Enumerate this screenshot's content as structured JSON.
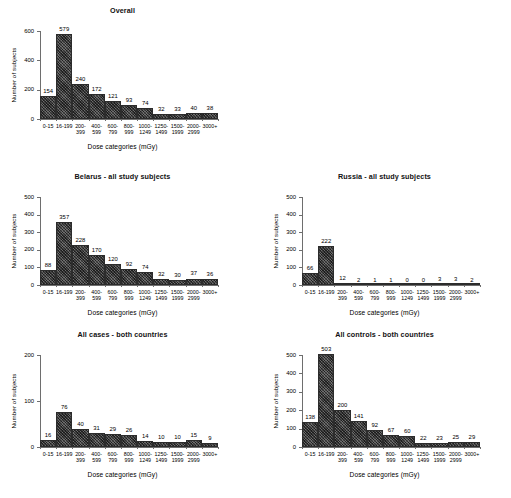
{
  "figure": {
    "background": "#ffffff",
    "bar_color": "#4b4b4b",
    "axis_color": "#6e6e6e",
    "xlabel": "Dose categories (mGy)",
    "ylabel": "Number of subjects",
    "categories": [
      "0-15",
      "16-199",
      "200-399",
      "400-599",
      "600-799",
      "800-999",
      "1000-1249",
      "1250-1499",
      "1500-1999",
      "2000-2999",
      "3000+"
    ],
    "category_lines": [
      [
        "0-15",
        ""
      ],
      [
        "16-199",
        ""
      ],
      [
        "200-",
        "399"
      ],
      [
        "400-",
        "599"
      ],
      [
        "600-",
        "799"
      ],
      [
        "800-",
        "999"
      ],
      [
        "1000-",
        "1249"
      ],
      [
        "1250-",
        "1499"
      ],
      [
        "1500-",
        "1999"
      ],
      [
        "2000-",
        "2999"
      ],
      [
        "3000+",
        ""
      ]
    ]
  },
  "chart_data": [
    {
      "id": "overall",
      "type": "bar",
      "title": "Overall",
      "xlabel": "Dose categories (mGy)",
      "ylabel": "Number of subjects",
      "categories": [
        "0-15",
        "16-199",
        "200-399",
        "400-599",
        "600-799",
        "800-999",
        "1000-1249",
        "1250-1499",
        "1500-1999",
        "2000-2999",
        "3000+"
      ],
      "values": [
        154,
        579,
        240,
        172,
        121,
        93,
        74,
        32,
        33,
        40,
        38
      ],
      "ylim": [
        0,
        600
      ],
      "yticks": [
        0,
        200,
        400,
        600
      ],
      "grid": false,
      "legend": "none"
    },
    {
      "id": "belarus",
      "type": "bar",
      "title": "Belarus - all study subjects",
      "xlabel": "Dose categories (mGy)",
      "ylabel": "Number of subjects",
      "categories": [
        "0-15",
        "16-199",
        "200-399",
        "400-599",
        "600-799",
        "800-999",
        "1000-1249",
        "1250-1499",
        "1500-1999",
        "2000-2999",
        "3000+"
      ],
      "values": [
        88,
        357,
        228,
        170,
        120,
        92,
        74,
        32,
        30,
        37,
        36
      ],
      "ylim": [
        0,
        500
      ],
      "yticks": [
        0,
        100,
        200,
        300,
        400,
        500
      ],
      "grid": false,
      "legend": "none"
    },
    {
      "id": "russia",
      "type": "bar",
      "title": "Russia - all study subjects",
      "xlabel": "Dose categories (mGy)",
      "ylabel": "Number of subjects",
      "categories": [
        "0-15",
        "16-199",
        "200-399",
        "400-599",
        "600-799",
        "800-999",
        "1000-1249",
        "1250-1499",
        "1500-1999",
        "2000-2999",
        "3000+"
      ],
      "values": [
        66,
        222,
        12,
        2,
        1,
        1,
        0,
        0,
        3,
        3,
        2
      ],
      "ylim": [
        0,
        500
      ],
      "yticks": [
        0,
        100,
        200,
        300,
        400,
        500
      ],
      "grid": false,
      "legend": "none"
    },
    {
      "id": "all-cases",
      "type": "bar",
      "title": "All cases - both countries",
      "xlabel": "Dose categories (mGy)",
      "ylabel": "Number of subjects",
      "categories": [
        "0-15",
        "16-199",
        "200-399",
        "400-599",
        "600-799",
        "800-999",
        "1000-1249",
        "1250-1499",
        "1500-1999",
        "2000-2999",
        "3000+"
      ],
      "values": [
        16,
        76,
        40,
        31,
        29,
        26,
        14,
        10,
        10,
        15,
        9
      ],
      "ylim": [
        0,
        200
      ],
      "yticks": [
        0,
        100,
        200
      ],
      "grid": false,
      "legend": "none"
    },
    {
      "id": "all-controls",
      "type": "bar",
      "title": "All controls - both countries",
      "xlabel": "Dose categories (mGy)",
      "ylabel": "Number of subjects",
      "categories": [
        "0-15",
        "16-199",
        "200-399",
        "400-599",
        "600-799",
        "800-999",
        "1000-1249",
        "1250-1499",
        "1500-1999",
        "2000-2999",
        "3000+"
      ],
      "values": [
        138,
        503,
        200,
        141,
        92,
        67,
        60,
        22,
        23,
        25,
        29
      ],
      "ylim": [
        0,
        500
      ],
      "yticks": [
        0,
        100,
        200,
        300,
        400,
        500
      ],
      "grid": false,
      "legend": "none"
    }
  ]
}
